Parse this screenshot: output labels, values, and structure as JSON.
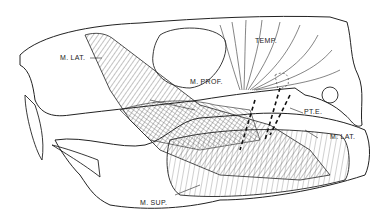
{
  "figure": {
    "labels": {
      "m_lat_upper": "M. LAT.",
      "temp": "TEMP.",
      "m_prof": "M. PROF.",
      "pte": "PT.E.",
      "m_lat_lower": "M. LAT.",
      "m_sup": "M. SUP."
    }
  }
}
